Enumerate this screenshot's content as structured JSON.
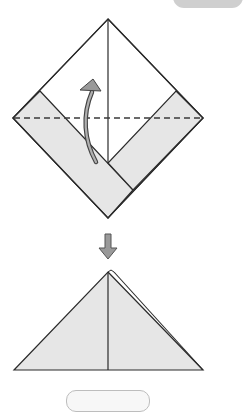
{
  "diagram": {
    "title": "Origami folding steps",
    "colors": {
      "paper_white": "#ffffff",
      "paper_shaded": "#e6e6e6",
      "line": "#2b2b2b",
      "arrow_fill": "#9a9a9a",
      "arrow_stroke": "#444444",
      "corner_tab": "#cfcfcf",
      "pill_border": "#bdbdbd"
    },
    "step1": {
      "label": "Valley fold along dashed line, folding bottom up",
      "shape": "diamond",
      "fold_line": "dashed horizontal",
      "arrow": "curved fold-up arrow"
    },
    "transition": {
      "label": "Result",
      "arrow": "down arrow"
    },
    "step2": {
      "label": "Folded triangle",
      "shape": "triangle"
    }
  }
}
